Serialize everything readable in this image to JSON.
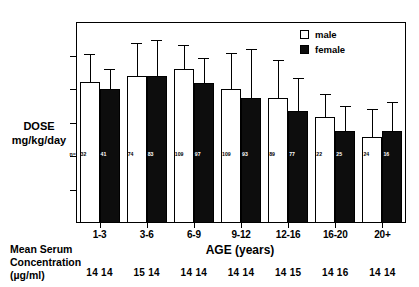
{
  "chart_data": {
    "type": "bar",
    "title": "",
    "xlabel": "AGE (years)",
    "ylabel": "DOSE\nmg/kg/day",
    "ylim": [
      0,
      30
    ],
    "yticks": [
      0,
      5,
      10,
      15,
      20,
      25,
      30
    ],
    "grid": false,
    "legend_position": "top-right",
    "categories": [
      "1-3",
      "3-6",
      "6-9",
      "9-12",
      "12-16",
      "16-20",
      "20+"
    ],
    "series": [
      {
        "name": "male",
        "color": "#ffffff",
        "values": [
          21,
          22,
          23,
          20,
          18.7,
          15.8,
          12.8
        ],
        "errors_upper": [
          25.2,
          26.8,
          26.5,
          25.4,
          24.3,
          19.3,
          17.0
        ],
        "n": [
          "32",
          "74",
          "109",
          "109",
          "89",
          "22",
          "24"
        ]
      },
      {
        "name": "female",
        "color": "#0d0d0d",
        "values": [
          20,
          22,
          20.9,
          18.7,
          16.7,
          13.8,
          13.7
        ],
        "errors_upper": [
          23.0,
          27.3,
          24.6,
          25.9,
          21.7,
          17.5,
          18.0
        ],
        "n": [
          "41",
          "83",
          "97",
          "93",
          "77",
          "25",
          "16"
        ]
      }
    ],
    "annotations": {
      "n_prefix": "n=",
      "serum_block_label": "Mean Serum\nConcentration\n(µg/ml)",
      "serum_values": [
        [
          "14",
          "14"
        ],
        [
          "15",
          "14"
        ],
        [
          "14",
          "14"
        ],
        [
          "14",
          "14"
        ],
        [
          "14",
          "15"
        ],
        [
          "14",
          "16"
        ],
        [
          "14",
          "14"
        ]
      ]
    }
  }
}
